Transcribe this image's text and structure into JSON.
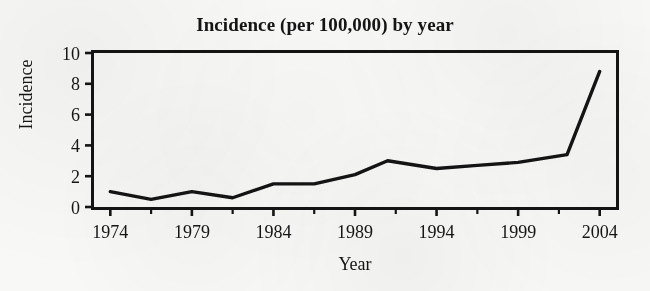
{
  "chart_data": {
    "type": "line",
    "title": "Incidence (per 100,000) by year",
    "xlabel": "Year",
    "ylabel": "Incidence",
    "xlim": [
      1973,
      2005
    ],
    "ylim": [
      0,
      10
    ],
    "grid": false,
    "legend": null,
    "x_ticks": [
      "1974",
      "1979",
      "1984",
      "1989",
      "1994",
      "1999",
      "2004"
    ],
    "x_tick_values": [
      1974,
      1979,
      1984,
      1989,
      1994,
      1999,
      2004
    ],
    "x_minor_tick_values": [
      1976.5,
      1981.5,
      1986.5,
      1991.5,
      1996.5,
      2001.5
    ],
    "y_ticks": [
      "0",
      "2",
      "4",
      "6",
      "8",
      "10"
    ],
    "y_tick_values": [
      0,
      2,
      4,
      6,
      8,
      10
    ],
    "series": [
      {
        "name": "Incidence",
        "color": "#141414",
        "x": [
          1974,
          1976.5,
          1979,
          1981.5,
          1984,
          1986.5,
          1989,
          1991,
          1994,
          1996.5,
          1999,
          2002,
          2004
        ],
        "values": [
          1.0,
          0.5,
          1.0,
          0.6,
          1.5,
          1.5,
          2.1,
          3.0,
          2.5,
          2.7,
          2.9,
          3.4,
          8.8
        ]
      }
    ]
  },
  "figure": {
    "background_color": "#f8f8f6",
    "axis_color": "#141414",
    "line_color": "#141414"
  }
}
